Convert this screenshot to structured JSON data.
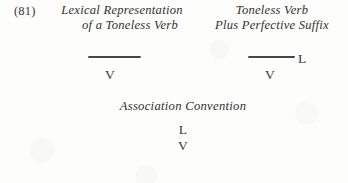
{
  "page": {
    "example_number": "(81)",
    "background_color": "#fdfdfc",
    "ink_color": "#32302d"
  },
  "columns": {
    "left": {
      "heading_line_1": "Lexical Representation",
      "heading_line_2": "of a Toneless Verb",
      "diagram": {
        "tone_tier_label": "",
        "segment": "V",
        "has_tone_line": true,
        "association": false
      }
    },
    "right": {
      "heading_line_1": "Toneless Verb",
      "heading_line_2": "Plus Perfective Suffix",
      "diagram": {
        "tone_tier_label": "L",
        "segment": "V",
        "has_tone_line": true,
        "association": false
      }
    }
  },
  "convention": {
    "label": "Association Convention",
    "result": {
      "tone": "L",
      "association_line": "|",
      "segment": "V"
    }
  }
}
